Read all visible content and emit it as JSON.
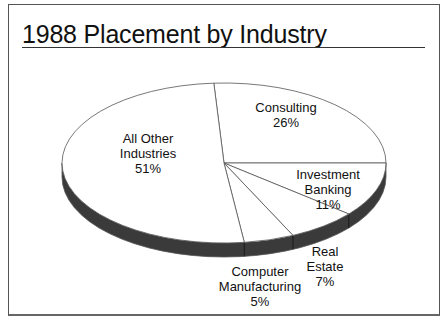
{
  "chart_data": {
    "type": "pie",
    "title": "1988 Placement by Industry",
    "style": "3d-tilted",
    "categories": [
      "Consulting",
      "Investment Banking",
      "Real Estate",
      "Computer Manufacturing",
      "All Other Industries"
    ],
    "values": [
      26,
      11,
      7,
      5,
      51
    ],
    "unit": "%",
    "labels": [
      {
        "line1": "Consulting",
        "line2": "",
        "pct": "26%"
      },
      {
        "line1": "Investment",
        "line2": "Banking",
        "pct": "11%"
      },
      {
        "line1": "Real",
        "line2": "Estate",
        "pct": "7%"
      },
      {
        "line1": "Computer",
        "line2": "Manufacturing",
        "pct": "5%"
      },
      {
        "line1": "All Other",
        "line2": "Industries",
        "pct": "51%"
      }
    ]
  },
  "colors": {
    "top": "#ffffff",
    "side": "#3a3a3a",
    "edge": "#555555"
  }
}
